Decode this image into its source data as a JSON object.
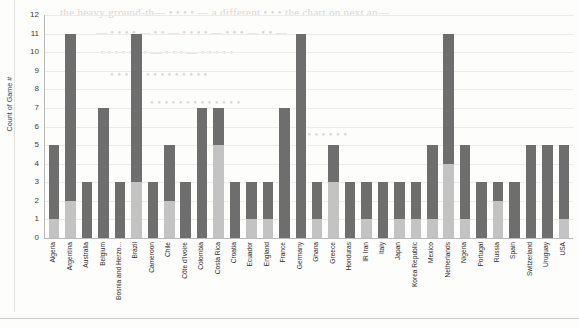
{
  "chart_data": {
    "type": "bar",
    "stacked": true,
    "title": "",
    "xlabel": "",
    "ylabel": "Count of Game #",
    "ylim": [
      0,
      12
    ],
    "ytick_labels": [
      "0",
      "1",
      "2",
      "3",
      "4",
      "5",
      "6",
      "7",
      "8",
      "9",
      "10",
      "11",
      "12"
    ],
    "yticks": [
      0,
      1,
      2,
      3,
      4,
      5,
      6,
      7,
      8,
      9,
      10,
      11,
      12
    ],
    "grid": true,
    "legend": "none",
    "colors": {
      "segment_top": "#6e6e6e",
      "segment_bottom": "#c3c3c3",
      "axis": "#b9b9b9",
      "gridline": "#eceaea",
      "text": "#2e2e2e"
    },
    "categories": [
      "Algeria",
      "Argentina",
      "Australia",
      "Belgium",
      "Bosnia and Herzo...",
      "Brazil",
      "Cameroon",
      "Chile",
      "Côte d'Ivoire",
      "Colombia",
      "Costa Rica",
      "Croatia",
      "Ecuador",
      "England",
      "France",
      "Germany",
      "Ghana",
      "Greece",
      "Honduras",
      "IR Iran",
      "Italy",
      "Japan",
      "Korea Republic",
      "Mexico",
      "Netherlands",
      "Nigeria",
      "Portugal",
      "Russia",
      "Spain",
      "Switzerland",
      "Uruguay",
      "USA"
    ],
    "series": [
      {
        "name": "lower-segment",
        "color": "#c3c3c3",
        "values": [
          1,
          2,
          0,
          0,
          0,
          3,
          0,
          2,
          0,
          0,
          5,
          0,
          1,
          1,
          0,
          0,
          1,
          3,
          0,
          1,
          0,
          1,
          1,
          1,
          4,
          1,
          0,
          2,
          0,
          0,
          0,
          1
        ]
      },
      {
        "name": "upper-segment",
        "color": "#6e6e6e",
        "values": [
          4,
          9,
          3,
          7,
          3,
          8,
          3,
          3,
          3,
          7,
          2,
          3,
          2,
          2,
          7,
          11,
          2,
          2,
          3,
          2,
          3,
          2,
          2,
          4,
          7,
          4,
          3,
          1,
          3,
          5,
          5,
          4
        ]
      }
    ],
    "totals": [
      5,
      11,
      3,
      7,
      3,
      11,
      3,
      5,
      3,
      7,
      7,
      3,
      3,
      3,
      7,
      11,
      3,
      5,
      3,
      3,
      3,
      3,
      3,
      5,
      11,
      5,
      3,
      3,
      3,
      5,
      5,
      5
    ]
  },
  "bleed_text": [
    {
      "x": 60,
      "y": 6,
      "text": "the heavy ground-th— • • • • — a different • • • the chart on next an—"
    },
    {
      "x": 96,
      "y": 26,
      "text": "— • • • • —   • •   — • • • • —  • • •  — • • —"
    },
    {
      "x": 100,
      "y": 46,
      "text": "• • • • • • •  — • • • —   • • • • •"
    },
    {
      "x": 110,
      "y": 68,
      "text": "• • • • • • • • • •   • • • •"
    },
    {
      "x": 150,
      "y": 96,
      "text": "• • • • • •   • • • • • • •"
    },
    {
      "x": 300,
      "y": 128,
      "text": "• • • • • • •"
    }
  ]
}
